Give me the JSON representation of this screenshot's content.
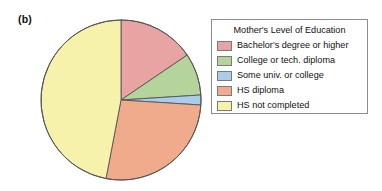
{
  "figure": {
    "panel_label": "(b)"
  },
  "legend": {
    "title": "Mother's Level of Education",
    "position": "right",
    "border_color": "#8d8d8d",
    "entries": [
      {
        "label": "Bachelor's degree or higher",
        "color": "#e8a3a3"
      },
      {
        "label": "College or tech. diploma",
        "color": "#b5d49c"
      },
      {
        "label": "Some univ. or college",
        "color": "#a9cde9"
      },
      {
        "label": "HS diploma",
        "color": "#f0ab8d"
      },
      {
        "label": "HS not completed",
        "color": "#f6f2ab"
      }
    ]
  },
  "chart_data": {
    "type": "pie",
    "title": "",
    "subtitle": "",
    "xlabel": "",
    "ylabel": "",
    "legend_title": "Mother's Level of Education",
    "legend_position": "right",
    "grid": false,
    "start_angle_deg": 0,
    "direction": "clockwise",
    "categories": [
      "Bachelor's degree or higher",
      "College or tech. diploma",
      "Some univ. or college",
      "HS diploma",
      "HS not completed"
    ],
    "values": [
      15.5,
      8.5,
      2.0,
      27.0,
      47.0
    ],
    "units": "percent",
    "slice_angles_deg": [
      55.8,
      30.6,
      7.2,
      97.2,
      169.2
    ],
    "colors": [
      "#e8a3a3",
      "#b5d49c",
      "#a9cde9",
      "#f0ab8d",
      "#f6f2ab"
    ],
    "slice_edge_color": "#555555",
    "annotations": [
      "(b)"
    ]
  }
}
